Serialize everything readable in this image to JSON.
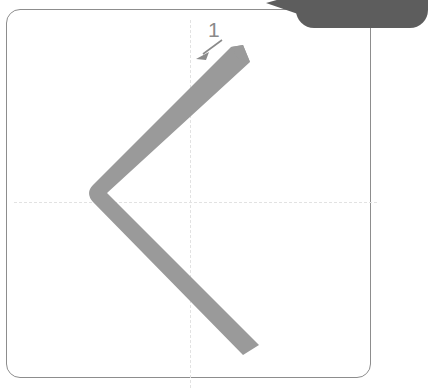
{
  "app": {
    "view_name": "stroke-order-practice-grid"
  },
  "tooltip": {
    "text": "追 傑  追 綿",
    "background_color": "#5d5d5d",
    "text_color": "#ffffff"
  },
  "grid": {
    "border_color": "#8d8d8d",
    "background_color": "#ffffff",
    "guide_color": "#e2e2e2",
    "guide_style": "dashed",
    "corner_radius": "14px"
  },
  "stroke": {
    "number_label": "1",
    "number_color": "#8a8a8a",
    "fill_color": "#9a9a9a",
    "arrow_color": "#8a8a8a",
    "shape_name": "piezhe-stroke",
    "description": "left-falling turning stroke"
  }
}
